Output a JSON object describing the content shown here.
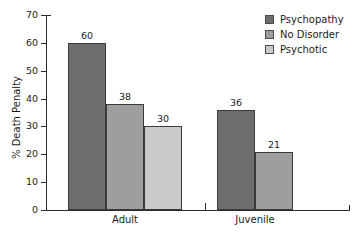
{
  "chart_data": {
    "type": "bar",
    "title": "",
    "subtitle": "",
    "xlabel": "",
    "ylabel": "% Death Penalty",
    "ylim": [
      0,
      70
    ],
    "yticks": [
      0,
      10,
      20,
      30,
      40,
      50,
      60,
      70
    ],
    "grid": false,
    "legend_position": "top-right",
    "categories": [
      "Adult",
      "Juvenile"
    ],
    "series": [
      {
        "name": "Psychopathy",
        "color": "#6e6e6e",
        "values": [
          60,
          36
        ]
      },
      {
        "name": "No Disorder",
        "color": "#9e9e9e",
        "values": [
          38,
          21
        ]
      },
      {
        "name": "Psychotic",
        "color": "#cacaca",
        "values": [
          30,
          null
        ]
      }
    ],
    "bars": [
      {
        "group": "Adult",
        "series": "Psychopathy",
        "value": 60,
        "label": "60",
        "color": "#6e6e6e"
      },
      {
        "group": "Adult",
        "series": "No Disorder",
        "value": 38,
        "label": "38",
        "color": "#9e9e9e"
      },
      {
        "group": "Adult",
        "series": "Psychotic",
        "value": 30,
        "label": "30",
        "color": "#cacaca"
      },
      {
        "group": "Juvenile",
        "series": "Psychopathy",
        "value": 36,
        "label": "36",
        "color": "#6e6e6e"
      },
      {
        "group": "Juvenile",
        "series": "No Disorder",
        "value": 21,
        "label": "21",
        "color": "#9e9e9e"
      }
    ]
  },
  "axis": {
    "y_title": "% Death Penalty",
    "tick_labels": [
      "70",
      "60",
      "50",
      "40",
      "30",
      "20",
      "10",
      "0"
    ],
    "category_labels": [
      "Adult",
      "Juvenile"
    ]
  },
  "legend": {
    "items": [
      {
        "label": "Psychopathy",
        "color": "#6e6e6e"
      },
      {
        "label": "No Disorder",
        "color": "#9e9e9e"
      },
      {
        "label": "Psychotic",
        "color": "#cacaca"
      }
    ]
  },
  "value_labels": [
    "60",
    "38",
    "30",
    "36",
    "21"
  ]
}
